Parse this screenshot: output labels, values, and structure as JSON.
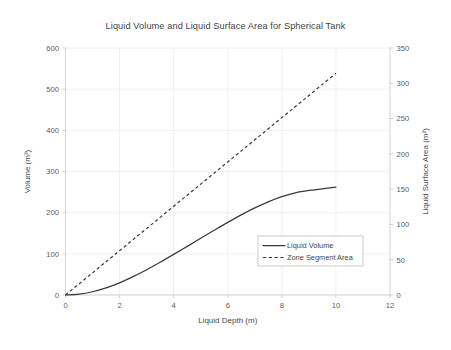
{
  "chart_data": {
    "type": "line",
    "title": "Liquid Volume and Liquid Surface Area for Spherical Tank",
    "xlabel": "Liquid Depth (m)",
    "ylabel": "Volume (m³)",
    "y2label": "Liquid Surface Area (m²)",
    "xlim": [
      0,
      12
    ],
    "ylim": [
      0,
      600
    ],
    "y2lim": [
      0,
      350
    ],
    "xticks": [
      "0",
      "2",
      "4",
      "6",
      "8",
      "10",
      "12"
    ],
    "xtick_values": [
      0,
      2,
      4,
      6,
      8,
      10,
      12
    ],
    "yticks": [
      "0",
      "100",
      "200",
      "300",
      "400",
      "500",
      "600"
    ],
    "ytick_values": [
      0,
      100,
      200,
      300,
      400,
      500,
      600
    ],
    "y2ticks": [
      "0",
      "50",
      "100",
      "150",
      "200",
      "250",
      "300",
      "350"
    ],
    "y2tick_values": [
      0,
      50,
      100,
      150,
      200,
      250,
      300,
      350
    ],
    "grid": true,
    "legend_position": "center-right-lower",
    "series": [
      {
        "name": "Liquid Volume",
        "style": "solid",
        "axis": "left",
        "color": "#3a3a3a",
        "x": [
          0,
          0.5,
          1,
          1.5,
          2,
          2.5,
          3,
          3.5,
          4,
          4.5,
          5,
          5.5,
          6,
          6.5,
          7,
          7.5,
          8,
          8.5,
          9,
          9.5,
          10
        ],
        "y": [
          0,
          2,
          7.9,
          17.2,
          29.6,
          44.5,
          61.3,
          79.6,
          98.7,
          118.2,
          137.8,
          157.3,
          176.4,
          194.7,
          211.5,
          226.4,
          238.8,
          248.1,
          254,
          258,
          261.8
        ]
      },
      {
        "name": "Zone Segment Area",
        "style": "dashed",
        "axis": "right",
        "color": "#3a3a3a",
        "x": [
          0,
          0.5,
          1,
          1.5,
          2,
          2.5,
          3,
          3.5,
          4,
          4.5,
          5,
          5.5,
          6,
          6.5,
          7,
          7.5,
          8,
          8.5,
          9,
          9.5,
          10
        ],
        "y": [
          0,
          15.7,
          31.4,
          47.1,
          62.8,
          78.5,
          94.2,
          110,
          125.7,
          141.4,
          157.1,
          172.8,
          188.5,
          204.2,
          219.9,
          235.6,
          251.3,
          267,
          282.7,
          298.5,
          314.2
        ]
      }
    ],
    "notes": {
      "volume_max_visible": 525,
      "area_max_visible": 314,
      "crossover_depth": 5.2
    }
  },
  "legend": {
    "items": [
      {
        "label": "Liquid Volume",
        "style": "solid"
      },
      {
        "label": "Zone Segment Area",
        "style": "dashed"
      }
    ]
  }
}
